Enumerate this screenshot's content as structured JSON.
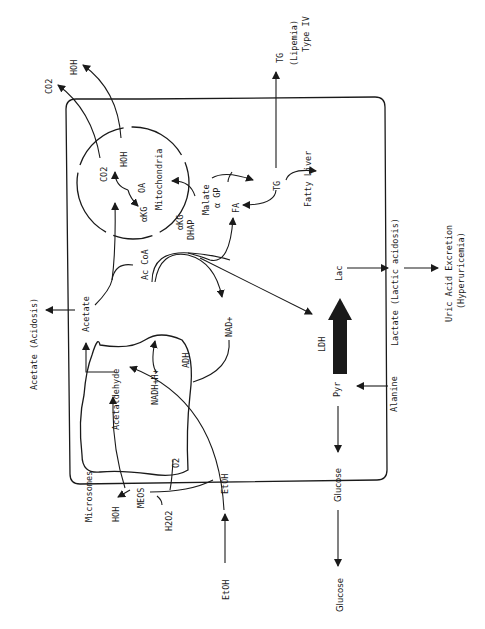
{
  "diagram": {
    "orientation": "rotated-90-ccw",
    "labels": {
      "co2_out": "CO2",
      "hoh_out": "HOH",
      "co2_in": "CO2",
      "hoh_in": "HOH",
      "oa": "OA",
      "akg_mito": "αKG",
      "mitochondria": "Mitochondria",
      "malate": "Malate",
      "agp": "α GP",
      "fa": "FA",
      "tg_in": "TG",
      "fatty_liver": "Fatty Liver",
      "tg_out": "TG",
      "lipemia": "(Lipemia)",
      "type_iv": "Type IV",
      "akg": "αKG",
      "dhap": "DHAP",
      "ac_coa": "Ac CoA",
      "acetate": "Acetate",
      "acetate_acidosis": "Acetate (Acidosis)",
      "acetaldehyde": "Acetaldehyde",
      "nadh": "NADH+H+",
      "nad": "NAD+",
      "adh": "ADH",
      "lac": "Lac",
      "ldh": "LDH",
      "pyr": "Pyr",
      "lactate_acidosis": "Lactate (Lactic acidosis)",
      "uric_acid": "Uric Acid Excretion",
      "hyperuricemia": "(Hyperuricemia)",
      "alanine": "Alanine",
      "glucose_in": "Glucose",
      "glucose_out": "Glucose",
      "microsomes": "Microsomes",
      "hoh_micro": "HOH",
      "meos": "MEOS",
      "o2": "O2",
      "h2o2": "H2O2",
      "etoh_in": "EtOH",
      "etoh_out": "EtOH"
    },
    "colors": {
      "ink": "#1a1a1a",
      "background": "#ffffff"
    }
  }
}
